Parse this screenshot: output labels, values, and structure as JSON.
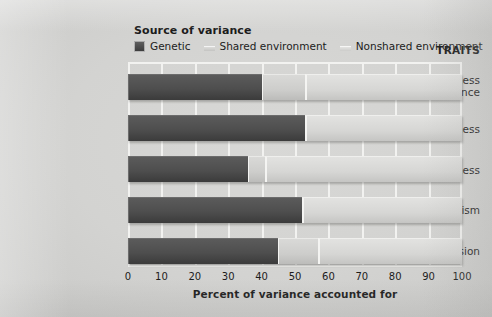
{
  "legend": {
    "title": "Source of variance",
    "items": [
      {
        "label": "Genetic",
        "key": "genetic",
        "color": "#4e4e4e",
        "icon": "legend-swatch-genetic"
      },
      {
        "label": "Shared environment",
        "key": "shared",
        "color": "#cdcdcb",
        "icon": "legend-swatch-shared"
      },
      {
        "label": "Nonshared environment",
        "key": "nonshared",
        "color": "#d6d6d4",
        "icon": "legend-swatch-nonshared"
      }
    ]
  },
  "axes": {
    "traits_heading": "TRAITS",
    "x_title": "Percent of variance accounted for",
    "x_ticks": [
      "0",
      "10",
      "20",
      "30",
      "40",
      "50",
      "60",
      "70",
      "80",
      "90",
      "100"
    ]
  },
  "chart_data": {
    "type": "bar",
    "orientation": "horizontal",
    "stacked": true,
    "title": "",
    "subtitle": "",
    "xlabel": "Percent of variance accounted for",
    "ylabel": "TRAITS",
    "xlim": [
      0,
      100
    ],
    "xticks": [
      0,
      10,
      20,
      30,
      40,
      50,
      60,
      70,
      80,
      90,
      100
    ],
    "grid": true,
    "grid_axis": "x",
    "legend_title": "Source of variance",
    "legend_position": "top-left",
    "categories": [
      "Openness to experience",
      "Conscientiousness",
      "Agreeableness",
      "Neuroticism",
      "Extraversion"
    ],
    "series": [
      {
        "name": "Genetic",
        "color": "#4e4e4e",
        "values": [
          40,
          53,
          36,
          52,
          45
        ]
      },
      {
        "name": "Shared environment",
        "color": "#cdcdcb",
        "values": [
          13,
          0,
          5,
          0,
          12
        ]
      },
      {
        "name": "Nonshared environment",
        "color": "#d6d6d4",
        "values": [
          47,
          47,
          59,
          48,
          43
        ]
      }
    ]
  },
  "traits": [
    {
      "line1": "Openness",
      "line2": "to experience"
    },
    {
      "line1": "Conscientiousness",
      "line2": ""
    },
    {
      "line1": "Agreeableness",
      "line2": ""
    },
    {
      "line1": "Neuroticism",
      "line2": ""
    },
    {
      "line1": "Extraversion",
      "line2": ""
    }
  ]
}
